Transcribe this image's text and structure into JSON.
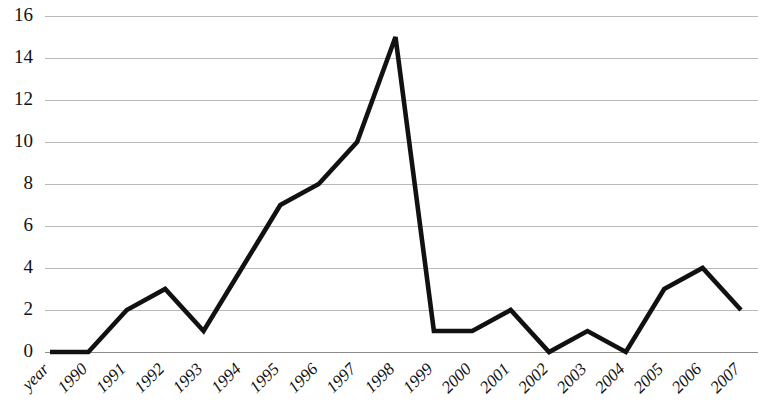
{
  "chart_data": {
    "type": "line",
    "title": "",
    "subtitle": "",
    "xlabel": "",
    "ylabel": "",
    "categories": [
      "year",
      "1990",
      "1991",
      "1992",
      "1993",
      "1994",
      "1995",
      "1996",
      "1997",
      "1998",
      "1999",
      "2000",
      "2001",
      "2002",
      "2003",
      "2004",
      "2005",
      "2006",
      "2007"
    ],
    "values": [
      0,
      0,
      2,
      3,
      1,
      4,
      7,
      8,
      10,
      15,
      1,
      1,
      2,
      0,
      1,
      0,
      3,
      4,
      2
    ],
    "series": [
      {
        "name": "",
        "values": [
          0,
          0,
          2,
          3,
          1,
          4,
          7,
          8,
          10,
          15,
          1,
          1,
          2,
          0,
          1,
          0,
          3,
          4,
          2
        ],
        "color": "#111111"
      }
    ],
    "ylim": [
      0,
      16
    ],
    "yticks": [
      0,
      2,
      4,
      6,
      8,
      10,
      12,
      14,
      16
    ],
    "ytick_labels": [
      "0",
      "2",
      "4",
      "6",
      "8",
      "10",
      "12",
      "14",
      "16"
    ],
    "xtick_labels": [
      "year",
      "1990",
      "1991",
      "1992",
      "1993",
      "1994",
      "1995",
      "1996",
      "1997",
      "1998",
      "1999",
      "2000",
      "2001",
      "2002",
      "2003",
      "2004",
      "2005",
      "2006",
      "2007"
    ],
    "grid": true,
    "grid_axis": "y",
    "legend": false,
    "legend_position": "none",
    "annotations": [],
    "colors": {
      "line": "#111111",
      "grid": "#b9b9b9",
      "axis": "#8c8c8c",
      "background": "#ffffff",
      "text": "#111111"
    }
  }
}
